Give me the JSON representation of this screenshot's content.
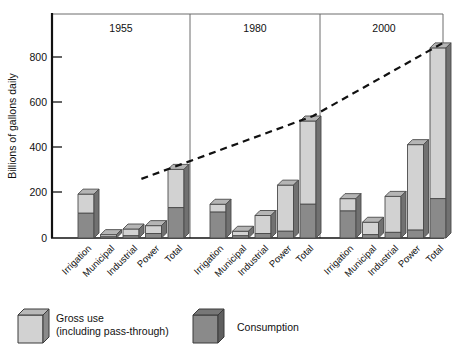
{
  "chart_data": {
    "type": "bar",
    "title": "",
    "subtitle": "",
    "xlabel": "",
    "ylabel": "Billions of gallons daily",
    "ylim": [
      0,
      900
    ],
    "yticks": [
      0,
      200,
      400,
      600,
      800
    ],
    "ytick_labels": [
      "0",
      "200",
      "400",
      "600",
      "800"
    ],
    "grid": false,
    "legend_position": "bottom-left",
    "panels": [
      "1955",
      "1980",
      "2000"
    ],
    "categories": [
      "Irrigation",
      "Municipal",
      "Industrial",
      "Power",
      "Total"
    ],
    "series": [
      {
        "name": "Gross use (including pass-through)",
        "color": "#d2d2d2",
        "values_by_panel": {
          "1955": [
            195,
            15,
            40,
            55,
            305
          ],
          "1980": [
            150,
            30,
            100,
            235,
            520
          ],
          "2000": [
            175,
            70,
            185,
            415,
            845
          ]
        }
      },
      {
        "name": "Consumption",
        "color": "#8a8a8a",
        "values_by_panel": {
          "1955": [
            110,
            5,
            10,
            20,
            135
          ],
          "1980": [
            115,
            10,
            20,
            30,
            150
          ],
          "2000": [
            120,
            15,
            25,
            35,
            175
          ]
        }
      }
    ],
    "annotations": [
      {
        "type": "trend-line",
        "style": "dashed",
        "label": "",
        "points": [
          {
            "panel": "1955",
            "category": "Total",
            "value": 305
          },
          {
            "panel": "1980",
            "category": "Total",
            "value": 520
          },
          {
            "panel": "2000",
            "category": "Total",
            "value": 845
          }
        ]
      }
    ]
  },
  "axis": {
    "y_title": "Billions of gallons daily",
    "tick_0": "0",
    "tick_200": "200",
    "tick_400": "400",
    "tick_600": "600",
    "tick_800": "800"
  },
  "panels": {
    "p1_label": "1955",
    "p2_label": "1980",
    "p3_label": "2000"
  },
  "categories": {
    "c1": "Irrigation",
    "c2": "Municipal",
    "c3": "Industrial",
    "c4": "Power",
    "c5": "Total"
  },
  "legend": {
    "gross_line1": "Gross use",
    "gross_line2": "(including pass-through)",
    "consumption": "Consumption",
    "gross_color": "#d2d2d2",
    "consumption_color": "#8a8a8a"
  }
}
